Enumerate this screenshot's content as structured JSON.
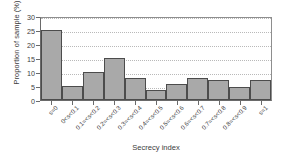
{
  "chart_data": {
    "type": "bar",
    "title": "",
    "xlabel": "Secrecy index",
    "ylabel": "Proportion of sample (%)",
    "ylim": [
      0,
      30
    ],
    "yticks": [
      0,
      5,
      10,
      15,
      20,
      25,
      30
    ],
    "grid": "horizontal-dotted",
    "legend": "none",
    "bar_color": "#a9a9a9",
    "bar_edge_color": "#4c4c4c",
    "axis_color": "#6a6a6a",
    "grid_color": "#b9b9b9",
    "categories": [
      "s=0",
      "0<s<0.1",
      "0.1=<s<0.2",
      "0.2=<s<0.3",
      "0.3=<s<0.4",
      "0.4=<s<0.5",
      "0.5=<s<0.6",
      "0.6=<s<0.7",
      "0.7=<s<0.8",
      "0.8=<s<0.9",
      "s=1"
    ],
    "values": [
      25.1,
      5.0,
      10.0,
      15.0,
      7.7,
      3.4,
      5.6,
      7.7,
      7.0,
      4.8,
      7.0
    ]
  }
}
